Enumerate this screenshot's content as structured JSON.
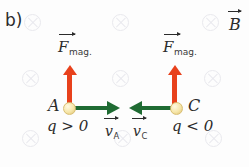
{
  "panel": {
    "label": "b)"
  },
  "colors": {
    "force_arrow": "#e8411c",
    "velocity_arrow": "#1f6b33",
    "charge_fill": "#f6e6a8",
    "field_symbol": "#e9e9ee",
    "text": "#2b2b2b"
  },
  "field": {
    "symbol_name": "magnetic-field-into-page-cross",
    "description": "uniform magnetic field directed into the page",
    "positions": [
      {
        "x": 24,
        "y": 14
      },
      {
        "x": 112,
        "y": 14
      },
      {
        "x": 202,
        "y": 14
      },
      {
        "x": 22,
        "y": 70
      },
      {
        "x": 112,
        "y": 70
      },
      {
        "x": 204,
        "y": 70
      },
      {
        "x": 22,
        "y": 130
      },
      {
        "x": 114,
        "y": 130
      },
      {
        "x": 205,
        "y": 130
      }
    ]
  },
  "field_label": {
    "symbol": "B",
    "name": "magnetic-field-vector-label"
  },
  "charges": [
    {
      "id": "A",
      "point_label": "A",
      "sign_label": "q > 0",
      "force_label_symbol": "F",
      "force_label_subscript": "mag.",
      "force_direction": "up",
      "velocity_label_symbol": "v",
      "velocity_label_subscript": "A",
      "velocity_direction": "right"
    },
    {
      "id": "C",
      "point_label": "C",
      "sign_label": "q < 0",
      "force_label_symbol": "F",
      "force_label_subscript": "mag.",
      "force_direction": "up",
      "velocity_label_symbol": "v",
      "velocity_label_subscript": "C",
      "velocity_direction": "left"
    }
  ]
}
